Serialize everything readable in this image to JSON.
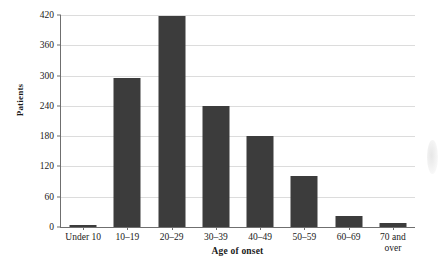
{
  "chart_data": {
    "type": "bar",
    "title": "",
    "xlabel": "Age of onset",
    "ylabel": "Patients",
    "categories": [
      "Under 10",
      "10–19",
      "20–29",
      "30–39",
      "40–49",
      "50–59",
      "60–69",
      "70 and over"
    ],
    "values": [
      4,
      295,
      418,
      240,
      181,
      101,
      22,
      7
    ],
    "ylim": [
      0,
      420
    ],
    "yticks": [
      0,
      60,
      120,
      180,
      240,
      300,
      360,
      420
    ],
    "ytick_labels": [
      "0",
      "60",
      "120",
      "180",
      "240",
      "300",
      "360",
      "420"
    ],
    "grid": true,
    "legend": false,
    "series": [
      {
        "name": "Patients",
        "color": "#3c3c3c",
        "values": [
          4,
          295,
          418,
          240,
          181,
          101,
          22,
          7
        ]
      }
    ],
    "category_lines": [
      [
        "Under 10"
      ],
      [
        "10–19"
      ],
      [
        "20–29"
      ],
      [
        "30–39"
      ],
      [
        "40–49"
      ],
      [
        "50–59"
      ],
      [
        "60–69"
      ],
      [
        "70 and",
        "over"
      ]
    ]
  },
  "colors": {
    "bar": "#3c3c3c",
    "gridline": "#dcdcdc",
    "axis": "#6f6f6f",
    "background": "#ffffff",
    "text": "#1a1a1a"
  }
}
